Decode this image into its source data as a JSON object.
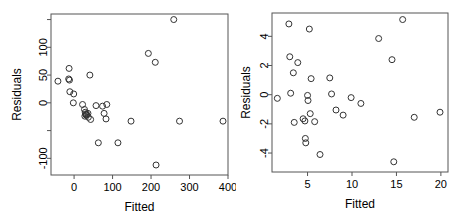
{
  "figure": {
    "title": "",
    "panel_count": 2
  },
  "chart_data": [
    {
      "type": "scatter",
      "title": "",
      "panel": "left",
      "xlabel": "Fitted",
      "ylabel": "Residuals",
      "xlim": [
        -60,
        400
      ],
      "ylim": [
        -130,
        160
      ],
      "xticks": [
        0,
        100,
        200,
        300,
        400
      ],
      "xticklabels": [
        "0",
        "100",
        "200",
        "300",
        "400"
      ],
      "yticks": [
        -100,
        -50,
        0,
        50,
        100,
        150
      ],
      "yticklabels": [
        "-100",
        "",
        "0",
        "50",
        "100",
        ""
      ],
      "grid": false,
      "legend": null,
      "marker": "open-circle",
      "points": [
        {
          "x": -42,
          "y": 39
        },
        {
          "x": -13,
          "y": 62
        },
        {
          "x": -14,
          "y": 43
        },
        {
          "x": -12,
          "y": 41
        },
        {
          "x": -11,
          "y": 20
        },
        {
          "x": -1,
          "y": 16
        },
        {
          "x": -2,
          "y": 0
        },
        {
          "x": 22,
          "y": -3
        },
        {
          "x": 27,
          "y": -12
        },
        {
          "x": 29,
          "y": -17
        },
        {
          "x": 30,
          "y": -20
        },
        {
          "x": 31,
          "y": -22
        },
        {
          "x": 28,
          "y": -24
        },
        {
          "x": 33,
          "y": -21
        },
        {
          "x": 36,
          "y": -19
        },
        {
          "x": 37,
          "y": -26
        },
        {
          "x": 43,
          "y": -30
        },
        {
          "x": 41,
          "y": 50
        },
        {
          "x": 57,
          "y": -5
        },
        {
          "x": 63,
          "y": -72
        },
        {
          "x": 74,
          "y": -6
        },
        {
          "x": 78,
          "y": -19
        },
        {
          "x": 85,
          "y": -3
        },
        {
          "x": 83,
          "y": -29
        },
        {
          "x": 114,
          "y": -72
        },
        {
          "x": 148,
          "y": -33
        },
        {
          "x": 193,
          "y": 89
        },
        {
          "x": 211,
          "y": 73
        },
        {
          "x": 213,
          "y": -112
        },
        {
          "x": 259,
          "y": 150
        },
        {
          "x": 274,
          "y": -33
        },
        {
          "x": 387,
          "y": -33
        }
      ]
    },
    {
      "type": "scatter",
      "title": "",
      "panel": "right",
      "xlabel": "Fitted",
      "ylabel": "Residuals",
      "xlim": [
        1.0,
        20.8
      ],
      "ylim": [
        -5.3,
        5.6
      ],
      "xticks": [
        5,
        10,
        15,
        20
      ],
      "xticklabels": [
        "5",
        "10",
        "15",
        "20"
      ],
      "yticks": [
        -4,
        -2,
        0,
        2,
        4
      ],
      "yticklabels": [
        "-4",
        "-2",
        "0",
        "2",
        "4"
      ],
      "grid": false,
      "legend": null,
      "marker": "open-circle",
      "points": [
        {
          "x": 1.6,
          "y": -0.25
        },
        {
          "x": 2.9,
          "y": 4.85
        },
        {
          "x": 3.0,
          "y": 2.6
        },
        {
          "x": 3.1,
          "y": 0.1
        },
        {
          "x": 3.4,
          "y": 1.5
        },
        {
          "x": 3.5,
          "y": -1.9
        },
        {
          "x": 3.9,
          "y": 2.2
        },
        {
          "x": 4.5,
          "y": -1.65
        },
        {
          "x": 4.7,
          "y": -1.8
        },
        {
          "x": 4.75,
          "y": -3.0
        },
        {
          "x": 4.8,
          "y": -3.3
        },
        {
          "x": 5.0,
          "y": -0.05
        },
        {
          "x": 5.05,
          "y": -0.4
        },
        {
          "x": 5.2,
          "y": 4.5
        },
        {
          "x": 5.4,
          "y": 1.1
        },
        {
          "x": 5.3,
          "y": -1.3
        },
        {
          "x": 5.8,
          "y": -1.85
        },
        {
          "x": 6.4,
          "y": -4.1
        },
        {
          "x": 7.5,
          "y": 1.15
        },
        {
          "x": 7.7,
          "y": 0.05
        },
        {
          "x": 8.2,
          "y": -1.05
        },
        {
          "x": 9.0,
          "y": -1.4
        },
        {
          "x": 9.9,
          "y": -0.2
        },
        {
          "x": 11.0,
          "y": -0.6
        },
        {
          "x": 13.0,
          "y": 3.85
        },
        {
          "x": 14.5,
          "y": 2.4
        },
        {
          "x": 14.7,
          "y": -4.6
        },
        {
          "x": 15.7,
          "y": 5.15
        },
        {
          "x": 17.0,
          "y": -1.55
        },
        {
          "x": 19.9,
          "y": -1.2
        }
      ]
    }
  ]
}
